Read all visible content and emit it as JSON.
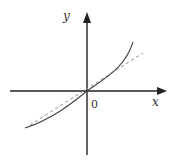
{
  "diagram": {
    "type": "function-graph",
    "axes": {
      "x_label": "x",
      "y_label": "y",
      "origin_label": "0"
    },
    "curves": [
      {
        "name": "solid-curve",
        "style": "solid",
        "description": "increasing convex-upward curve through origin"
      },
      {
        "name": "dashed-line",
        "style": "dashed",
        "description": "straight line through origin (tangent)"
      }
    ],
    "colors": {
      "axis": "#222222",
      "curve": "#444444",
      "dashed": "#888888"
    }
  }
}
